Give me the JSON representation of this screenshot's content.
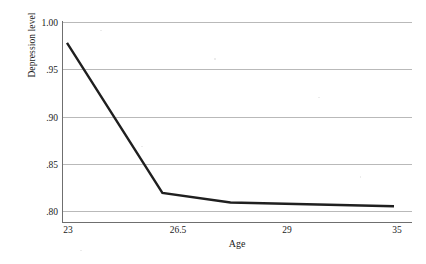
{
  "chart_data": {
    "type": "line",
    "title": "",
    "xlabel": "Age",
    "ylabel": "Depression level",
    "x": [
      23,
      26.5,
      29,
      35
    ],
    "xtick_labels": [
      "23",
      "26.5",
      "29",
      "35"
    ],
    "values": [
      0.978,
      0.819,
      0.809,
      0.805
    ],
    "series": [
      {
        "name": "Depression level",
        "values": [
          0.978,
          0.819,
          0.809,
          0.805
        ]
      }
    ],
    "ylim": [
      0.795,
      1.005
    ],
    "ytick_values": [
      1.0,
      0.95,
      0.9,
      0.85,
      0.8
    ],
    "ytick_labels": [
      "1.00",
      ".95",
      ".90",
      ".85",
      ".80"
    ],
    "grid": "horizontal",
    "legend": "none",
    "line_color": "#1f1f1f",
    "grid_color": "#b9b9b9",
    "axis_color": "#6f6f6f",
    "background": "#ffffff",
    "annotations": []
  },
  "axes": {
    "x_title": "Age",
    "y_title": "Depression level"
  }
}
